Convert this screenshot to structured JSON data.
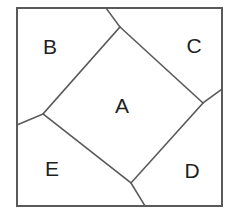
{
  "figure": {
    "background_color": "#ffffff",
    "stroke_color": "#5a5a5a",
    "label_color": "#1f1f1f",
    "outer_square": {
      "name": "outer-square",
      "x": 17,
      "y": 8,
      "width": 205,
      "height": 198
    },
    "inner_square": {
      "name": "inner-square",
      "points": "120,27 203,103 131,183 43,114"
    },
    "extension_segments": [
      {
        "name": "segment-top",
        "x1": 120,
        "y1": 27,
        "x2": 106,
        "y2": 8
      },
      {
        "name": "segment-right",
        "x1": 203,
        "y1": 103,
        "x2": 222,
        "y2": 89
      },
      {
        "name": "segment-bottom",
        "x1": 131,
        "y1": 183,
        "x2": 145,
        "y2": 206
      },
      {
        "name": "segment-left",
        "x1": 43,
        "y1": 114,
        "x2": 17,
        "y2": 125
      }
    ],
    "labels": [
      {
        "id": "A",
        "text": "A",
        "x": 122,
        "y": 107
      },
      {
        "id": "B",
        "text": "B",
        "x": 50,
        "y": 48
      },
      {
        "id": "C",
        "text": "C",
        "x": 194,
        "y": 47
      },
      {
        "id": "D",
        "text": "D",
        "x": 192,
        "y": 172
      },
      {
        "id": "E",
        "text": "E",
        "x": 52,
        "y": 170
      }
    ]
  }
}
